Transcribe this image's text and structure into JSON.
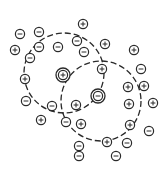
{
  "diagram": {
    "title": "",
    "colors": {
      "stroke": "#2a2a2a",
      "background": "#ffffff"
    },
    "atmospheres": [
      {
        "id": "atmosphere-cation",
        "cx": 64,
        "cy": 73,
        "r": 40
      },
      {
        "id": "atmosphere-anion",
        "cx": 101,
        "cy": 101,
        "r": 40
      }
    ],
    "central_ions": [
      {
        "id": "central-cation",
        "sign": "+",
        "x": 63,
        "y": 75
      },
      {
        "id": "central-anion",
        "sign": "-",
        "x": 98,
        "y": 96
      }
    ],
    "ions": [
      {
        "sign": "-",
        "x": 20,
        "y": 34
      },
      {
        "sign": "-",
        "x": 39,
        "y": 32
      },
      {
        "sign": "+",
        "x": 15,
        "y": 50
      },
      {
        "sign": "-",
        "x": 39,
        "y": 47
      },
      {
        "sign": "-",
        "x": 30,
        "y": 58
      },
      {
        "sign": "-",
        "x": 58,
        "y": 47
      },
      {
        "sign": "+",
        "x": 83,
        "y": 24
      },
      {
        "sign": "-",
        "x": 77,
        "y": 41
      },
      {
        "sign": "-",
        "x": 84,
        "y": 52
      },
      {
        "sign": "+",
        "x": 105,
        "y": 44
      },
      {
        "sign": "+",
        "x": 134,
        "y": 50
      },
      {
        "sign": "+",
        "x": 102,
        "y": 69
      },
      {
        "sign": "-",
        "x": 141,
        "y": 69
      },
      {
        "sign": "+",
        "x": 25,
        "y": 79
      },
      {
        "sign": "-",
        "x": 26,
        "y": 101
      },
      {
        "sign": "-",
        "x": 52,
        "y": 106
      },
      {
        "sign": "+",
        "x": 76,
        "y": 105
      },
      {
        "sign": "+",
        "x": 41,
        "y": 120
      },
      {
        "sign": "-",
        "x": 66,
        "y": 122
      },
      {
        "sign": "+",
        "x": 81,
        "y": 124
      },
      {
        "sign": "+",
        "x": 128,
        "y": 87
      },
      {
        "sign": "+",
        "x": 144,
        "y": 86
      },
      {
        "sign": "+",
        "x": 129,
        "y": 104
      },
      {
        "sign": "+",
        "x": 153,
        "y": 103
      },
      {
        "sign": "+",
        "x": 130,
        "y": 125
      },
      {
        "sign": "-",
        "x": 149,
        "y": 131
      },
      {
        "sign": "+",
        "x": 107,
        "y": 142
      },
      {
        "sign": "-",
        "x": 127,
        "y": 143
      },
      {
        "sign": "-",
        "x": 116,
        "y": 156
      },
      {
        "sign": "-",
        "x": 79,
        "y": 146
      },
      {
        "sign": "-",
        "x": 79,
        "y": 156
      }
    ]
  }
}
